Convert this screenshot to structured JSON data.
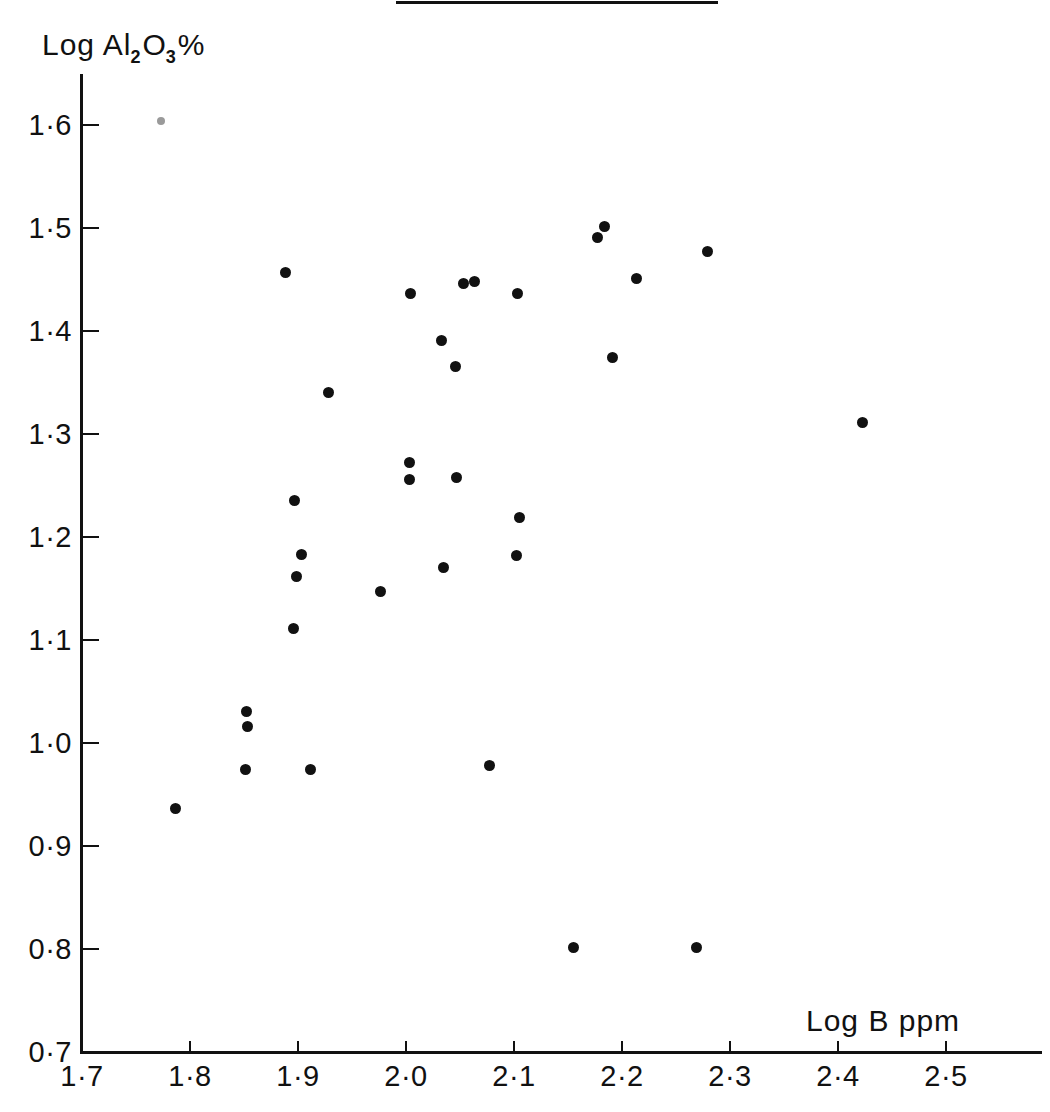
{
  "figure": {
    "has_top_rule": true,
    "ink_color": "#111111",
    "background_color": "#ffffff"
  },
  "chart_data": {
    "type": "scatter",
    "title": "",
    "xlabel": "Log B  ppm",
    "ylabel": "Log Al2O3%",
    "ylabel_parts": {
      "prefix": "Log Al",
      "sub1": "2",
      "mid": "O",
      "sub2": "3",
      "suffix": "%"
    },
    "xlim": [
      1.7,
      2.56
    ],
    "ylim": [
      0.7,
      1.67
    ],
    "grid": false,
    "legend": null,
    "xticks": [
      1.7,
      1.8,
      1.9,
      2.0,
      2.1,
      2.2,
      2.3,
      2.4,
      2.5
    ],
    "xticklabels": [
      "1·7",
      "1·8",
      "1·9",
      "2·0",
      "2·1",
      "2·2",
      "2·3",
      "2·4",
      "2·5"
    ],
    "yticks": [
      0.7,
      0.8,
      0.9,
      1.0,
      1.1,
      1.2,
      1.3,
      1.4,
      1.5,
      1.6
    ],
    "yticklabels": [
      "0·7",
      "0·8",
      "0·9",
      "1·0",
      "1·1",
      "1·2",
      "1·3",
      "1·4",
      "1·5",
      "1·6"
    ],
    "marker": "filled-circle",
    "marker_color": "#111111",
    "n_points": 36,
    "points": [
      {
        "x": 1.787,
        "y": 0.936
      },
      {
        "x": 1.852,
        "y": 1.031
      },
      {
        "x": 1.853,
        "y": 1.016
      },
      {
        "x": 1.851,
        "y": 0.974
      },
      {
        "x": 1.888,
        "y": 1.457
      },
      {
        "x": 1.897,
        "y": 1.235
      },
      {
        "x": 1.903,
        "y": 1.183
      },
      {
        "x": 1.899,
        "y": 1.162
      },
      {
        "x": 1.896,
        "y": 1.111
      },
      {
        "x": 1.912,
        "y": 0.974
      },
      {
        "x": 1.928,
        "y": 1.34
      },
      {
        "x": 1.976,
        "y": 1.147
      },
      {
        "x": 2.004,
        "y": 1.436
      },
      {
        "x": 2.003,
        "y": 1.272
      },
      {
        "x": 2.003,
        "y": 1.256
      },
      {
        "x": 2.033,
        "y": 1.391
      },
      {
        "x": 2.035,
        "y": 1.17
      },
      {
        "x": 2.046,
        "y": 1.366
      },
      {
        "x": 2.047,
        "y": 1.258
      },
      {
        "x": 2.053,
        "y": 1.446
      },
      {
        "x": 2.063,
        "y": 1.448
      },
      {
        "x": 2.077,
        "y": 0.978
      },
      {
        "x": 2.103,
        "y": 1.436
      },
      {
        "x": 2.105,
        "y": 1.219
      },
      {
        "x": 2.102,
        "y": 1.182
      },
      {
        "x": 2.155,
        "y": 0.801
      },
      {
        "x": 2.177,
        "y": 1.491
      },
      {
        "x": 2.184,
        "y": 1.501
      },
      {
        "x": 2.191,
        "y": 1.374
      },
      {
        "x": 2.213,
        "y": 1.451
      },
      {
        "x": 2.269,
        "y": 0.801
      },
      {
        "x": 2.279,
        "y": 1.477
      },
      {
        "x": 2.423,
        "y": 1.311
      },
      {
        "x": 1.773,
        "y": 1.604,
        "faint": true
      }
    ]
  }
}
